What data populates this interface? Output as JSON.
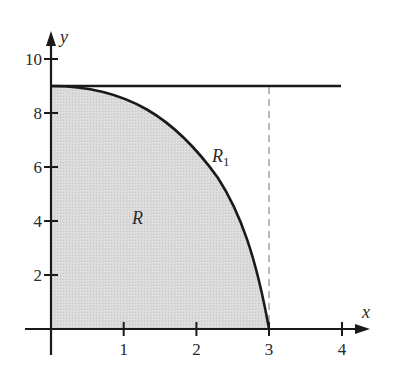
{
  "diagram": {
    "type": "region-between-curves",
    "curve": "y = 9 - x^2",
    "horizontal_line": "y = 9",
    "vertical_dashed_line": "x = 3",
    "axes": {
      "x_label": "x",
      "y_label": "y",
      "x_ticks": [
        "1",
        "2",
        "3",
        "4"
      ],
      "y_ticks": [
        "2",
        "4",
        "6",
        "8",
        "10"
      ]
    },
    "regions": {
      "shaded": {
        "label": "R",
        "fill": "#d9d9d9"
      },
      "unshaded": {
        "label": "R",
        "subscript": "1"
      }
    },
    "colors": {
      "stroke": "#1a1a1a",
      "dashed": "#8a8a8a",
      "fill": "#d9d9d9"
    }
  }
}
